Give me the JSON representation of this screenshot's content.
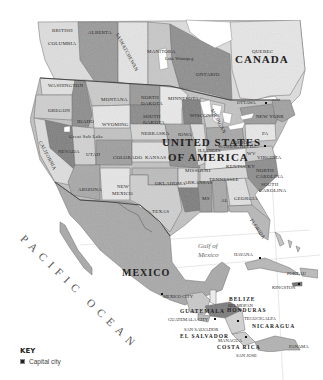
{
  "map": {
    "title": "North America",
    "countries": [
      {
        "name": "CANADA",
        "x": 235,
        "y": 54,
        "size": 11
      },
      {
        "name": "UNITED STATES",
        "x": 162,
        "y": 137,
        "size": 11
      },
      {
        "name": "OF AMERICA",
        "x": 168,
        "y": 152,
        "size": 11
      },
      {
        "name": "MEXICO",
        "x": 122,
        "y": 268,
        "size": 10
      },
      {
        "name": "BELIZE",
        "x": 229,
        "y": 297,
        "size": 5.5
      },
      {
        "name": "GUATEMALA",
        "x": 180,
        "y": 309,
        "size": 5.5
      },
      {
        "name": "HONDURAS",
        "x": 227,
        "y": 308,
        "size": 5.5
      },
      {
        "name": "NICARAGUA",
        "x": 252,
        "y": 324,
        "size": 5.5
      },
      {
        "name": "EL SALVADOR",
        "x": 180,
        "y": 334,
        "size": 5.5
      },
      {
        "name": "COSTA RICA",
        "x": 217,
        "y": 345,
        "size": 5.5
      }
    ],
    "regions": [
      {
        "name": "BRITISH",
        "x": 52,
        "y": 28
      },
      {
        "name": "COLUMBIA",
        "x": 48,
        "y": 41
      },
      {
        "name": "ALBERTA",
        "x": 88,
        "y": 30
      },
      {
        "name": "SASKATCHEWAN",
        "x": 119,
        "y": 32,
        "rotate": 62
      },
      {
        "name": "MANITOBA",
        "x": 147,
        "y": 49
      },
      {
        "name": "ONTARIO",
        "x": 196,
        "y": 72
      },
      {
        "name": "QUEBEC",
        "x": 252,
        "y": 49
      },
      {
        "name": "WASHINGTON",
        "x": 48,
        "y": 83
      },
      {
        "name": "OREGON",
        "x": 48,
        "y": 108
      },
      {
        "name": "IDAHO",
        "x": 77,
        "y": 119
      },
      {
        "name": "MONTANA",
        "x": 101,
        "y": 97
      },
      {
        "name": "NORTH",
        "x": 141,
        "y": 95
      },
      {
        "name": "DAKOTA",
        "x": 141,
        "y": 101
      },
      {
        "name": "SOUTH",
        "x": 143,
        "y": 114
      },
      {
        "name": "DAKOTA",
        "x": 143,
        "y": 120
      },
      {
        "name": "WYOMING",
        "x": 102,
        "y": 122
      },
      {
        "name": "NEBRASKA",
        "x": 141,
        "y": 131
      },
      {
        "name": "MINNESOTA",
        "x": 168,
        "y": 96
      },
      {
        "name": "WISCONSIN",
        "x": 190,
        "y": 113
      },
      {
        "name": "MICHIGAN",
        "x": 214,
        "y": 108,
        "rotate": 62
      },
      {
        "name": "IOWA",
        "x": 178,
        "y": 132
      },
      {
        "name": "ILLINOIS",
        "x": 198,
        "y": 148
      },
      {
        "name": "OHIO",
        "x": 234,
        "y": 140
      },
      {
        "name": "PA",
        "x": 262,
        "y": 131
      },
      {
        "name": "NEW YORK",
        "x": 256,
        "y": 114
      },
      {
        "name": "NEVADA",
        "x": 58,
        "y": 149
      },
      {
        "name": "UTAH",
        "x": 86,
        "y": 152
      },
      {
        "name": "Great Salt Lake",
        "x": 69,
        "y": 134
      },
      {
        "name": "CALIFORNIA",
        "x": 42,
        "y": 140,
        "rotate": 62
      },
      {
        "name": "COLORADO",
        "x": 113,
        "y": 155
      },
      {
        "name": "KANSAS",
        "x": 145,
        "y": 155
      },
      {
        "name": "MISSOURI",
        "x": 185,
        "y": 168
      },
      {
        "name": "KENTUCKY",
        "x": 226,
        "y": 164
      },
      {
        "name": "WV",
        "x": 247,
        "y": 151
      },
      {
        "name": "VIRGINIA",
        "x": 257,
        "y": 155
      },
      {
        "name": "NORTH",
        "x": 256,
        "y": 168
      },
      {
        "name": "CAROLINA",
        "x": 256,
        "y": 174
      },
      {
        "name": "SOUTH",
        "x": 261,
        "y": 182
      },
      {
        "name": "CAROLINA",
        "x": 259,
        "y": 188
      },
      {
        "name": "TENNESSEE",
        "x": 209,
        "y": 177
      },
      {
        "name": "ARKANSAS",
        "x": 184,
        "y": 180
      },
      {
        "name": "OKLAHOMA",
        "x": 155,
        "y": 181
      },
      {
        "name": "ARIZONA",
        "x": 78,
        "y": 187
      },
      {
        "name": "NEW",
        "x": 117,
        "y": 184
      },
      {
        "name": "MEXICO",
        "x": 112,
        "y": 191
      },
      {
        "name": "TEXAS",
        "x": 152,
        "y": 209
      },
      {
        "name": "MS",
        "x": 202,
        "y": 196
      },
      {
        "name": "AL",
        "x": 221,
        "y": 198
      },
      {
        "name": "GEORGIA",
        "x": 234,
        "y": 196
      },
      {
        "name": "FLORIDA",
        "x": 253,
        "y": 218,
        "rotate": 55
      }
    ],
    "cities": [
      {
        "name": "OTTAWA",
        "x": 237,
        "y": 101,
        "cx": 265,
        "cy": 103
      },
      {
        "name": "WASHINGTON D.C.",
        "x": 218,
        "y": 145,
        "cx": 264,
        "cy": 146
      },
      {
        "name": "HAVANA",
        "x": 234,
        "y": 253,
        "cx": 259,
        "cy": 258
      },
      {
        "name": "PORT AU",
        "x": 287,
        "y": 272,
        "cx": null,
        "cy": null
      },
      {
        "name": "KINGSTON",
        "x": 272,
        "y": 286,
        "cx": 298,
        "cy": 284
      },
      {
        "name": "MEXICO CITY",
        "x": 163,
        "y": 295,
        "cx": 161,
        "cy": 294
      },
      {
        "name": "BELMOPAN",
        "x": 228,
        "y": 304,
        "cx": null,
        "cy": null
      },
      {
        "name": "GUATEMALA CITY",
        "x": 168,
        "y": 318,
        "cx": 214,
        "cy": 319
      },
      {
        "name": "TEGUCIGALPA",
        "x": 244,
        "y": 317,
        "cx": 237,
        "cy": 321
      },
      {
        "name": "SAN SALVADOR",
        "x": 184,
        "y": 328,
        "cx": null,
        "cy": null
      },
      {
        "name": "MANAGUA",
        "x": 218,
        "y": 339,
        "cx": 245,
        "cy": 337
      },
      {
        "name": "SAN JOSE",
        "x": 236,
        "y": 354,
        "cx": null,
        "cy": null
      },
      {
        "name": "PANAMA",
        "x": 289,
        "y": 345,
        "cx": null,
        "cy": null
      },
      {
        "name": "Lake Winnipeg",
        "x": 165,
        "y": 57,
        "cx": null,
        "cy": null
      }
    ],
    "water": [
      {
        "name": "Gulf of",
        "x": 198,
        "y": 243,
        "size": 7
      },
      {
        "name": "Mexico",
        "x": 198,
        "y": 252,
        "size": 7
      }
    ],
    "ocean": {
      "name": "PACIFIC OCEAN",
      "x": 26,
      "y": 233,
      "rotate": 44
    }
  },
  "key": {
    "title": "KEY",
    "items": [
      {
        "icon": "capital-dot-icon",
        "label": "Capital city"
      }
    ]
  },
  "colors": {
    "land_light": "#d9d9d9",
    "land_mid": "#b4b4b4",
    "land_dark": "#8f8f8f",
    "water": "#ffffff",
    "border": "#5a5a5a",
    "text": "#2a2a2a"
  }
}
